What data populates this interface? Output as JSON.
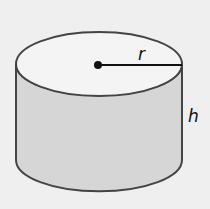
{
  "diagram": {
    "labels": {
      "radius": "r",
      "height": "h"
    },
    "colors": {
      "background": "#efefef",
      "side_fill": "#d6d6d6",
      "top_fill": "#f4f4f4",
      "stroke": "#444444"
    }
  }
}
